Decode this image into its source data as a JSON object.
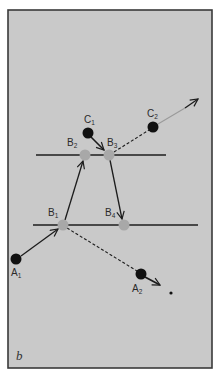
{
  "figure": {
    "panel_label": "b",
    "background_color": "#c9c9c9",
    "frame_color": "#3a3a3a",
    "black_particle_color": "#111111",
    "gray_particle_color": "#a8a8a8",
    "line_color": "#1c1c1c"
  },
  "planes": [
    {
      "name": "upper-plane",
      "y": 155,
      "x1": 36,
      "x2": 166
    },
    {
      "name": "lower-plane",
      "y": 225,
      "x1": 33,
      "x2": 198
    }
  ],
  "points": {
    "A1": {
      "label": "A",
      "sub": "1",
      "x": 16,
      "y": 259,
      "kind": "black",
      "label_x": 11,
      "label_y": 276
    },
    "A2": {
      "label": "A",
      "sub": "2",
      "x": 141,
      "y": 274,
      "kind": "black",
      "label_x": 132,
      "label_y": 292
    },
    "B1": {
      "label": "B",
      "sub": "1",
      "x": 63,
      "y": 225,
      "kind": "gray",
      "label_x": 48,
      "label_y": 216
    },
    "B2": {
      "label": "B",
      "sub": "2",
      "x": 85,
      "y": 155,
      "kind": "gray",
      "label_x": 67,
      "label_y": 146
    },
    "B3": {
      "label": "B",
      "sub": "3",
      "x": 109,
      "y": 155,
      "kind": "gray",
      "label_x": 107,
      "label_y": 146
    },
    "B4": {
      "label": "B",
      "sub": "4",
      "x": 124,
      "y": 225,
      "kind": "gray",
      "label_x": 105,
      "label_y": 216
    },
    "C1": {
      "label": "C",
      "sub": "1",
      "x": 88,
      "y": 133,
      "kind": "black",
      "label_x": 84,
      "label_y": 123
    },
    "C2": {
      "label": "C",
      "sub": "2",
      "x": 153,
      "y": 127,
      "kind": "black",
      "label_x": 147,
      "label_y": 117
    }
  },
  "end_dot": {
    "x": 171,
    "y": 293
  },
  "paths": [
    {
      "from": "A1",
      "to": "B1",
      "style": "solid",
      "arrow": true
    },
    {
      "from": "B1",
      "to": "B2",
      "style": "solid",
      "arrow": true
    },
    {
      "from": "C1",
      "to": "B3",
      "style": "solid",
      "arrow": true
    },
    {
      "from": "B3",
      "to": "B4",
      "style": "solid",
      "arrow": true
    },
    {
      "from": "B3",
      "to": "C2",
      "style": "dashed",
      "arrow": false
    },
    {
      "from": "C2",
      "to": "out",
      "style": "faint",
      "arrow": true
    },
    {
      "from": "B1",
      "to": "A2",
      "style": "dashed",
      "arrow": false
    },
    {
      "from": "A2",
      "to": "out",
      "style": "solid",
      "arrow": true
    }
  ]
}
